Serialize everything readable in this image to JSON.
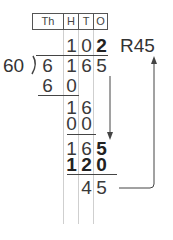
{
  "place_value_headers": [
    "Th",
    "H",
    "T",
    "O"
  ],
  "divisor": "60",
  "quotient": {
    "digits": [
      "1",
      "0",
      "2"
    ],
    "remainder_label": "R45"
  },
  "dividend": [
    "6",
    "1",
    "6",
    "5"
  ],
  "steps": [
    {
      "row": [
        "6",
        "0"
      ]
    },
    {
      "row": [
        "1",
        "6"
      ]
    },
    {
      "row": [
        "0",
        "0"
      ]
    },
    {
      "row": [
        "1",
        "6",
        "5"
      ]
    },
    {
      "row": [
        "1",
        "2",
        "0"
      ]
    },
    {
      "row": [
        "4",
        "5"
      ]
    }
  ],
  "colors": {
    "text": "#333333",
    "grid": "#cfcfcf",
    "lines": "#444444"
  }
}
